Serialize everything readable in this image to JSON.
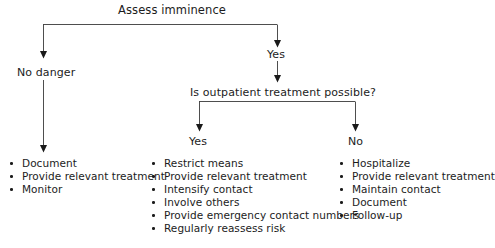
{
  "diagram": {
    "type": "flowchart",
    "title": "Assess imminence",
    "root": {
      "label": "Assess imminence"
    },
    "branches": {
      "level1_left_label": "No danger",
      "level1_right_label": "Yes",
      "decision2_label": "Is outpatient treatment possible?",
      "level2_left_label": "Yes",
      "level2_right_label": "No"
    },
    "columns": [
      {
        "name": "no-danger-actions",
        "heading": "No danger",
        "items": [
          "Document",
          "Provide relevant treatment",
          "Monitor"
        ]
      },
      {
        "name": "outpatient-yes-actions",
        "heading": "Yes",
        "items": [
          "Restrict means",
          "Provide relevant treatment",
          "Intensify contact",
          "Involve others",
          "Provide emergency contact numbers",
          "Regularly reassess risk"
        ]
      },
      {
        "name": "outpatient-no-actions",
        "heading": "No",
        "items": [
          "Hospitalize",
          "Provide relevant treatment",
          "Maintain contact",
          "Document",
          "Follow-up"
        ]
      }
    ],
    "colors": {
      "background": "#ffffff",
      "text": "#1c1c1c",
      "connector": "#3a3a3a",
      "arrowhead": "#1a1a1a"
    }
  }
}
